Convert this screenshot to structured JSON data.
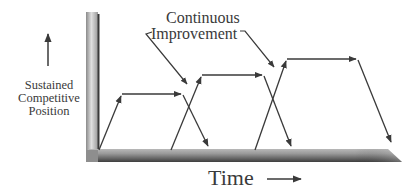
{
  "diagram": {
    "y_axis": {
      "label_lines": [
        "Sustained",
        "Competitive",
        "Position"
      ],
      "direction_arrow": "up-arrow"
    },
    "x_axis": {
      "label": "Time",
      "direction_arrow": "right-arrow"
    },
    "annotation": {
      "lines": [
        "Continuous",
        "Improvement"
      ],
      "pointer_count": 2
    },
    "cycles": [
      {
        "name": "cycle-1",
        "rise_start": [
          99,
          150
        ],
        "plateau_start": [
          122,
          94
        ],
        "plateau_end": [
          182,
          94
        ],
        "decline_end": [
          209,
          148
        ]
      },
      {
        "name": "cycle-2",
        "rise_start": [
          171,
          150
        ],
        "plateau_start": [
          202,
          75
        ],
        "plateau_end": [
          263,
          75
        ],
        "decline_end": [
          292,
          148
        ]
      },
      {
        "name": "cycle-3",
        "rise_start": [
          255,
          150
        ],
        "plateau_start": [
          287,
          59
        ],
        "plateau_end": [
          357,
          59
        ],
        "decline_end": [
          392,
          144
        ]
      }
    ],
    "colors": {
      "line": "#3a3a3a",
      "axis_dark": "#4a4a4a",
      "axis_light": "#d8d8d8",
      "text": "#3a3a3a"
    }
  }
}
